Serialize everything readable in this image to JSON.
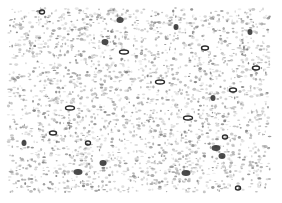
{
  "image": {
    "description": "Grayscale histology micrograph showing densely packed stained cells with scattered darker ring-shaped and dense cell bodies",
    "palette": {
      "background": "#ffffff",
      "tissue_light": "#d4d4d4",
      "tissue_mid": "#9a9a9a",
      "cell_dark": "#2a2a2a"
    }
  }
}
